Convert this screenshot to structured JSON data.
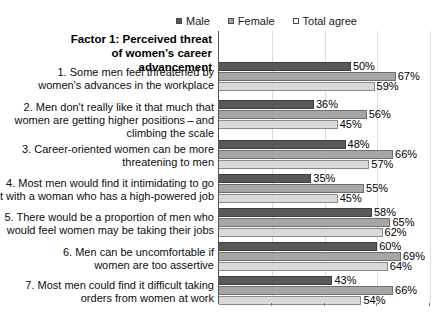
{
  "chart_data": {
    "type": "bar",
    "orientation": "horizontal",
    "title": "Factor 1: Perceived threat of\nwomen's career advancement",
    "xlabel": "",
    "ylabel": "",
    "xlim": [
      0,
      80
    ],
    "grid": true,
    "gridlines": [
      0,
      20,
      40,
      60,
      80
    ],
    "value_suffix": "%",
    "legend_position": "top",
    "legend": [
      "Male",
      "Female",
      "Total agree"
    ],
    "series": [
      {
        "name": "Male",
        "color": "#595959",
        "values": [
          50,
          36,
          48,
          35,
          58,
          60,
          43
        ]
      },
      {
        "name": "Female",
        "color": "#a6a6a6",
        "values": [
          67,
          56,
          66,
          55,
          65,
          69,
          66
        ]
      },
      {
        "name": "Total agree",
        "color": "#d9d9d9",
        "values": [
          59,
          45,
          57,
          45,
          62,
          64,
          54
        ]
      }
    ],
    "categories": [
      "1.  Some men feel threatened by\nwomen's advances in the workplace",
      "2. Men don't really like it that much that\nwomen are getting higher positions – and\nclimbing the scale",
      "3. Career-oriented women can be more\nthreatening to men",
      "4. Most men would find it intimidating to go\nout with a woman who has a high-powered job",
      "5. There would be a proportion of men who\nwould feel women may be taking their jobs",
      "6. Men can be uncomfortable if\nwomen are too assertive",
      "7. Most men could find it difficult taking\norders from women at work"
    ],
    "data_labels": [
      {
        "category": 1,
        "Male": "50%",
        "Female": "67%",
        "Total agree": "59%"
      },
      {
        "category": 2,
        "Male": "36%",
        "Female": "56%",
        "Total agree": "45%"
      },
      {
        "category": 3,
        "Male": "48%",
        "Female": "66%",
        "Total agree": "57%"
      },
      {
        "category": 4,
        "Male": "35%",
        "Female": "55%",
        "Total agree": "45%"
      },
      {
        "category": 5,
        "Male": "58%",
        "Female": "65%",
        "Total agree": "62%"
      },
      {
        "category": 6,
        "Male": "60%",
        "Female": "69%",
        "Total agree": "64%"
      },
      {
        "category": 7,
        "Male": "43%",
        "Female": "66%",
        "Total agree": "54%"
      }
    ]
  },
  "legend": {
    "items": [
      {
        "label": "Male",
        "swatch": "#595959"
      },
      {
        "label": "Female",
        "swatch": "#a6a6a6"
      },
      {
        "label": "Total agree",
        "swatch": "#ffffff"
      }
    ]
  },
  "colors": {
    "male": "#595959",
    "female": "#a6a6a6",
    "total": "#d9d9d9",
    "axis": "#555555",
    "grid": "#dcdcdc",
    "text": "#000000",
    "background": "#ffffff"
  },
  "layout": {
    "plot_left_px": 218,
    "plot_top_px": 31,
    "plot_width_px": 211,
    "plot_height_px": 272,
    "value_scale_max": 80
  }
}
